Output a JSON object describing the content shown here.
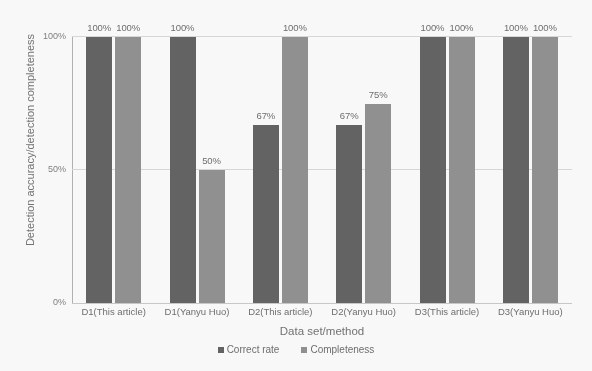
{
  "chart_data": {
    "type": "bar",
    "title": "",
    "xlabel": "Data set/method",
    "ylabel": "Detection accuracy/detection completeness",
    "categories": [
      "D1(This article)",
      "D1(Yanyu Huo)",
      "D2(This article)",
      "D2(Yanyu Huo)",
      "D3(This article)",
      "D3(Yanyu Huo)"
    ],
    "series": [
      {
        "name": "Correct rate",
        "color": "#5e5e5e",
        "values": [
          100,
          100,
          67,
          67,
          100,
          100
        ],
        "labels": [
          "100%",
          "100%",
          "67%",
          "67%",
          "100%",
          "100%"
        ]
      },
      {
        "name": "Completeness",
        "color": "#8e8e8e",
        "values": [
          100,
          50,
          100,
          75,
          100,
          100
        ],
        "labels": [
          "100%",
          "50%",
          "100%",
          "75%",
          "100%",
          "100%"
        ]
      }
    ],
    "ylim": [
      0,
      100
    ],
    "yticks": [
      "0%",
      "50%",
      "100%"
    ],
    "ytick_values": [
      0,
      50,
      100
    ],
    "grid": true,
    "gridlines_at": [
      50,
      100
    ],
    "legend_position": "bottom",
    "value_suffix": "%"
  }
}
